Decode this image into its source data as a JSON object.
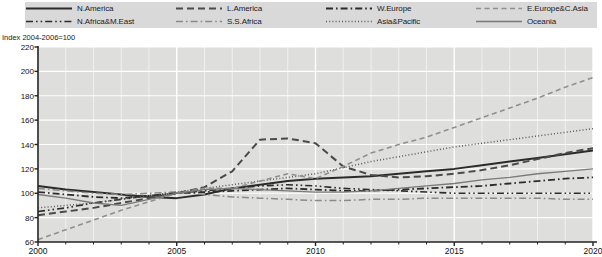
{
  "legend": {
    "items": [
      {
        "label": "N.America",
        "style": "solid",
        "color": "#2b2b2b",
        "width": 2.0
      },
      {
        "label": "N.Africa&M.East",
        "style": "dash-dot-dot",
        "color": "#2b2b2b",
        "width": 1.6
      },
      {
        "label": "L.America",
        "style": "dash-long",
        "color": "#4a4a4a",
        "width": 2.0
      },
      {
        "label": "S.S.Africa",
        "style": "dash-dot",
        "color": "#8a8a8a",
        "width": 1.5
      },
      {
        "label": "W.Europe",
        "style": "dash-dot",
        "color": "#2b2b2b",
        "width": 1.8
      },
      {
        "label": "Asia&Pacific",
        "style": "dotted",
        "color": "#5a5a5a",
        "width": 1.5
      },
      {
        "label": "E.Europe&C.Asia",
        "style": "dash-med",
        "color": "#8f8f8f",
        "width": 1.6
      },
      {
        "label": "Oceania",
        "style": "solid",
        "color": "#7a7a7a",
        "width": 1.3
      }
    ]
  },
  "chart_data": {
    "type": "line",
    "title": "",
    "ylabel": "Index 2004-2006=100",
    "xlabel": "",
    "ylim": [
      60,
      220
    ],
    "yticks": [
      60,
      80,
      100,
      120,
      140,
      160,
      180,
      200,
      220
    ],
    "xlim": [
      2000,
      2020
    ],
    "xticks": [
      2000,
      2005,
      2010,
      2015,
      2020
    ],
    "xtick_labels": [
      "2000",
      "2005",
      "2010",
      "2015",
      "2020"
    ],
    "xminor_step": 1,
    "grid": true,
    "legend_position": "top",
    "x": [
      2000,
      2001,
      2002,
      2003,
      2004,
      2005,
      2006,
      2007,
      2008,
      2009,
      2010,
      2011,
      2012,
      2013,
      2014,
      2015,
      2016,
      2017,
      2018,
      2019,
      2020
    ],
    "series": [
      {
        "name": "N.America",
        "style": "solid",
        "color": "#2b2b2b",
        "width": 2.0,
        "values": [
          106,
          103,
          101,
          99,
          97,
          96,
          99,
          104,
          107,
          110,
          112,
          113,
          114,
          116,
          118,
          120,
          123,
          126,
          129,
          132,
          135
        ]
      },
      {
        "name": "N.Africa&M.East",
        "style": "dash-dot-dot",
        "color": "#2b2b2b",
        "width": 1.6,
        "values": [
          85,
          88,
          92,
          95,
          98,
          100,
          102,
          104,
          106,
          107,
          106,
          104,
          103,
          102,
          101,
          100,
          100,
          100,
          100,
          100,
          100
        ]
      },
      {
        "name": "L.America",
        "style": "dash-long",
        "color": "#4a4a4a",
        "width": 2.0,
        "values": [
          82,
          85,
          88,
          92,
          96,
          100,
          105,
          118,
          144,
          145,
          141,
          122,
          115,
          113,
          114,
          116,
          119,
          123,
          128,
          133,
          137
        ]
      },
      {
        "name": "S.S.Africa",
        "style": "dash-dot",
        "color": "#8a8a8a",
        "width": 1.5,
        "values": [
          104,
          102,
          100,
          99,
          100,
          101,
          99,
          97,
          96,
          95,
          94,
          94,
          95,
          95,
          96,
          96,
          96,
          96,
          96,
          95,
          95
        ]
      },
      {
        "name": "W.Europe",
        "style": "dash-dot",
        "color": "#2b2b2b",
        "width": 1.8,
        "values": [
          101,
          99,
          97,
          96,
          98,
          100,
          101,
          102,
          103,
          104,
          103,
          102,
          102,
          103,
          104,
          105,
          106,
          108,
          110,
          112,
          113
        ]
      },
      {
        "name": "Asia&Pacific",
        "style": "dotted",
        "color": "#5a5a5a",
        "width": 1.5,
        "values": [
          88,
          90,
          92,
          95,
          98,
          101,
          104,
          107,
          110,
          113,
          116,
          121,
          126,
          130,
          134,
          138,
          141,
          144,
          147,
          150,
          153
        ]
      },
      {
        "name": "E.Europe&C.Asia",
        "style": "dash-med",
        "color": "#8f8f8f",
        "width": 1.6,
        "values": [
          62,
          70,
          78,
          86,
          93,
          100,
          104,
          104,
          110,
          116,
          112,
          122,
          133,
          140,
          146,
          154,
          162,
          170,
          178,
          187,
          195
        ]
      },
      {
        "name": "Oceania",
        "style": "solid",
        "color": "#7a7a7a",
        "width": 1.3,
        "values": [
          99,
          96,
          92,
          90,
          95,
          100,
          103,
          104,
          103,
          102,
          101,
          101,
          102,
          104,
          106,
          108,
          111,
          113,
          116,
          118,
          120
        ]
      }
    ]
  }
}
